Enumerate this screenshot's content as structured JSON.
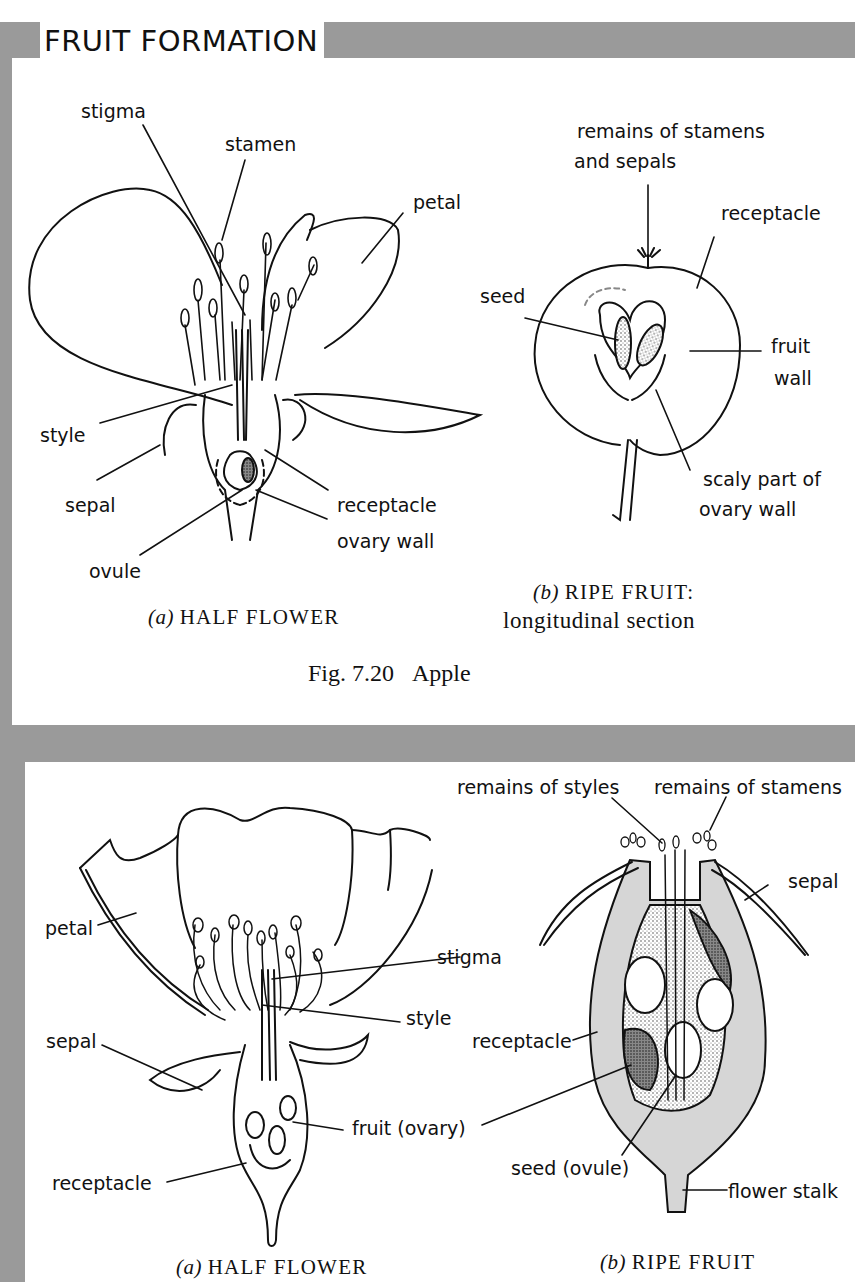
{
  "header": {
    "title": "FRUIT FORMATION"
  },
  "colors": {
    "frame_gray": "#9a9a9a",
    "background": "#ffffff",
    "ink": "#111111",
    "shading": "#d6d6d6"
  },
  "figure_top": {
    "number": "Fig. 7.20",
    "subject": "Apple",
    "panel_a": {
      "letter": "(a)",
      "caption": "HALF FLOWER",
      "labels": [
        "stigma",
        "stamen",
        "petal",
        "style",
        "sepal",
        "receptacle",
        "ovary wall",
        "ovule"
      ]
    },
    "panel_b": {
      "letter": "(b)",
      "caption": "RIPE FRUIT:",
      "caption_line2": "longitudinal section",
      "labels": [
        "remains of stamens",
        "and sepals",
        "receptacle",
        "seed",
        "fruit",
        "wall",
        "scaly part of",
        "ovary wall"
      ]
    }
  },
  "figure_bottom": {
    "panel_a": {
      "letter": "(a)",
      "caption": "HALF FLOWER",
      "labels": [
        "petal",
        "stigma",
        "style",
        "sepal",
        "fruit (ovary)",
        "receptacle"
      ]
    },
    "panel_b": {
      "letter": "(b)",
      "caption": "RIPE FRUIT",
      "labels": [
        "remains of styles",
        "remains of stamens",
        "sepal",
        "receptacle",
        "seed (ovule)",
        "flower stalk"
      ]
    }
  }
}
